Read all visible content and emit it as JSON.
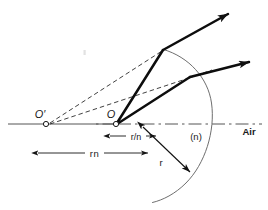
{
  "figure": {
    "background_color": "#ffffff",
    "ink_color": "#1a1a1a",
    "thin_line_color": "#4d4d4d",
    "width": 268,
    "height": 210
  },
  "labels": {
    "object_point": "O",
    "image_point": "O′",
    "distance_rn": "rn",
    "distance_r_over_n": "r/n",
    "radius": "r",
    "medium_index": "(n)",
    "medium_air": "Air"
  },
  "geometry": {
    "axis": {
      "y": 124,
      "x_start": 8,
      "x_end": 262,
      "solid_end": 118,
      "style_left": "solid",
      "style_right": "dash-dot"
    },
    "points": {
      "O_prime": {
        "x": 46,
        "y": 124,
        "marker": "open-circle"
      },
      "O": {
        "x": 116,
        "y": 124,
        "marker": "open-circle"
      },
      "center": {
        "x": 116,
        "y": 124
      },
      "ray1_surface_hit": {
        "x": 163,
        "y": 50
      },
      "ray2_surface_hit": {
        "x": 190,
        "y": 77
      },
      "ray1_tip": {
        "x": 228,
        "y": 13
      },
      "ray2_tip": {
        "x": 250,
        "y": 62
      },
      "arc_top": {
        "x": 163,
        "y": 50
      },
      "arc_bottom": {
        "x": 152,
        "y": 202
      },
      "arc_right": {
        "x": 212,
        "y": 124
      }
    },
    "dimension_rn": {
      "x1": 38,
      "x2": 148,
      "y": 153
    },
    "dimension_r_over_n": {
      "x1": 110,
      "x2": 156,
      "y": 136
    },
    "radius_arrow": {
      "x1": 143,
      "y1": 127,
      "x2": 190,
      "y2": 172
    },
    "label_positions": {
      "O_prime": {
        "x": 40,
        "y": 117
      },
      "O": {
        "x": 112,
        "y": 117
      },
      "rn": {
        "x": 93,
        "y": 156
      },
      "r_over_n": {
        "x": 133,
        "y": 139
      },
      "r": {
        "x": 162,
        "y": 163
      },
      "n": {
        "x": 196,
        "y": 139
      },
      "Air": {
        "x": 249,
        "y": 134
      }
    },
    "speck": {
      "x": 84,
      "y": 52
    }
  }
}
